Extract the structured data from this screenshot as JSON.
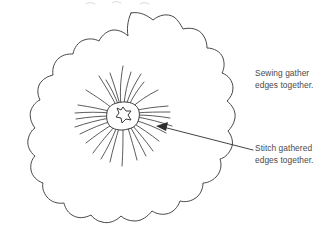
{
  "diagram": {
    "background_color": "#ffffff",
    "line_color": "#3a3a3a",
    "text_color": "#4a4a4a",
    "shapes": {
      "outer_edge_name": "scalloped fabric circle",
      "center_name": "gathered center opening",
      "gather_name": "radiating gather folds"
    }
  },
  "annotations": {
    "sewing": {
      "line1": "Sewing gather",
      "line2": "edges together."
    },
    "stitch": {
      "line1": "Stitch gathered",
      "line2": "edges together."
    }
  }
}
